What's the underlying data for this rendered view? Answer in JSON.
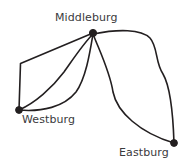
{
  "diagram": {
    "type": "node-link-map",
    "background_color": "#ffffff",
    "stroke_color": "#231f20",
    "label_color": "#3a3a3c",
    "nodes": [
      {
        "id": "middleburg",
        "label": "Middleburg",
        "x": 93,
        "y": 33,
        "radius": 3.6,
        "label_x": 55,
        "label_y": 12
      },
      {
        "id": "westburg",
        "label": "Westburg",
        "x": 19,
        "y": 110,
        "radius": 3.4,
        "label_x": 22,
        "label_y": 114
      },
      {
        "id": "eastburg",
        "label": "Eastburg",
        "x": 174,
        "y": 143,
        "radius": 3.4,
        "label_x": 119,
        "label_y": 147
      }
    ],
    "edges": [
      {
        "id": "west-middle-upper",
        "from": "westburg",
        "to": "middleburg",
        "description": "upper angular route with corner at top-left",
        "path": "M 19 110 L 20.5 63.5 L 93 33"
      },
      {
        "id": "west-middle-middle",
        "from": "westburg",
        "to": "middleburg",
        "description": "middle S-curved route",
        "path": "M 19 110 C 35 103 52 88 64 72 C 74 58 83 44 93 34"
      },
      {
        "id": "west-middle-lower",
        "from": "westburg",
        "to": "middleburg",
        "description": "lower bowed route passing below",
        "path": "M 19 110 C 42 112 64 107 76 92 C 86 78 90 52 93 34"
      },
      {
        "id": "middle-east-inner",
        "from": "middleburg",
        "to": "eastburg",
        "description": "inner route bowing right then down to Eastburg",
        "path": "M 93 34 C 100 52 110 72 113 92 C 117 112 140 133 174 143"
      },
      {
        "id": "middle-east-outer",
        "from": "middleburg",
        "to": "eastburg",
        "description": "outer route running east then south along the right edge",
        "path": "M 93 34 C 118 29 141 29 150 38 C 158 47 155 62 163 74 C 170 86 173 112 174 143"
      }
    ]
  }
}
